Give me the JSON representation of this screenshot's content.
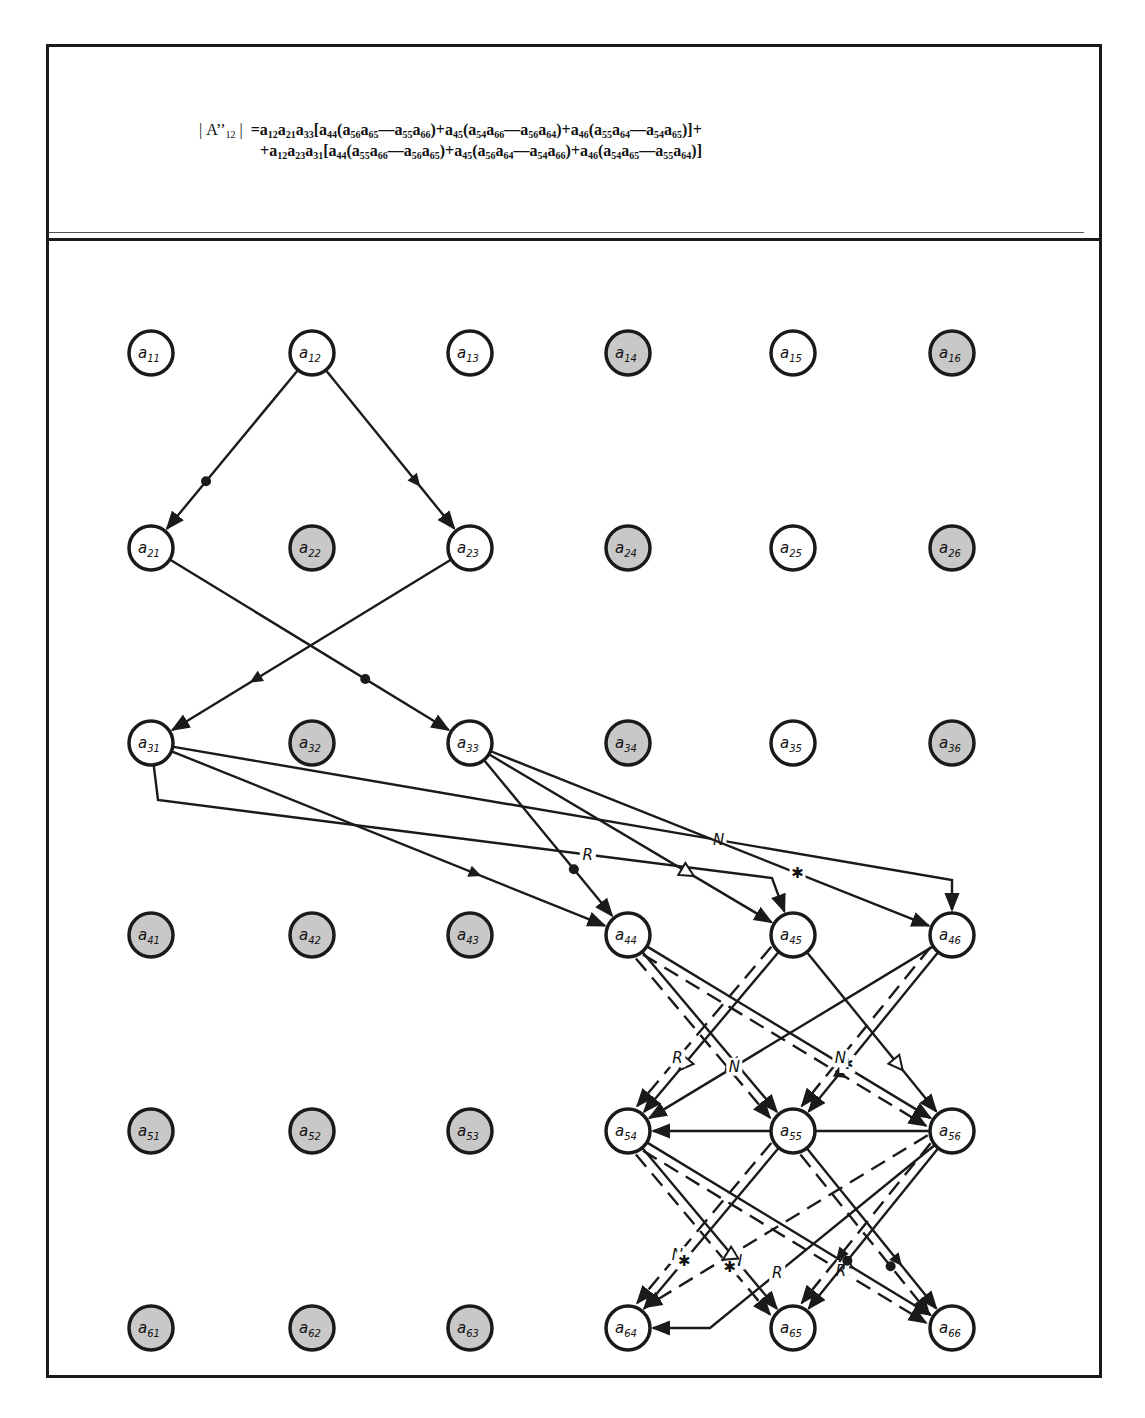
{
  "title_formula": {
    "lhs": "| A''12 |",
    "line1_tokens": [
      {
        "t": "a",
        "s": "12"
      },
      {
        "t": "a",
        "s": "21"
      },
      {
        "t": "a",
        "s": "33"
      },
      {
        "t": "["
      },
      {
        "t": "a",
        "s": "44"
      },
      {
        "t": "("
      },
      {
        "t": "a",
        "s": "56"
      },
      {
        "t": "a",
        "s": "65"
      },
      {
        "t": "—"
      },
      {
        "t": "a",
        "s": "55"
      },
      {
        "t": "a",
        "s": "66"
      },
      {
        "t": ")+"
      },
      {
        "t": "a",
        "s": "45"
      },
      {
        "t": "("
      },
      {
        "t": "a",
        "s": "54"
      },
      {
        "t": "a",
        "s": "66"
      },
      {
        "t": "—"
      },
      {
        "t": "a",
        "s": "56"
      },
      {
        "t": "a",
        "s": "64"
      },
      {
        "t": ")+"
      },
      {
        "t": "a",
        "s": "46"
      },
      {
        "t": "("
      },
      {
        "t": "a",
        "s": "55"
      },
      {
        "t": "a",
        "s": "64"
      },
      {
        "t": "—"
      },
      {
        "t": "a",
        "s": "54"
      },
      {
        "t": "a",
        "s": "65"
      },
      {
        "t": ")]+"
      }
    ],
    "line2_tokens": [
      {
        "t": "+"
      },
      {
        "t": "a",
        "s": "12"
      },
      {
        "t": "a",
        "s": "23"
      },
      {
        "t": "a",
        "s": "31"
      },
      {
        "t": "["
      },
      {
        "t": "a",
        "s": "44"
      },
      {
        "t": "("
      },
      {
        "t": "a",
        "s": "55"
      },
      {
        "t": "a",
        "s": "66"
      },
      {
        "t": "—"
      },
      {
        "t": "a",
        "s": "56"
      },
      {
        "t": "a",
        "s": "65"
      },
      {
        "t": ")+"
      },
      {
        "t": "a",
        "s": "45"
      },
      {
        "t": "("
      },
      {
        "t": "a",
        "s": "56"
      },
      {
        "t": "a",
        "s": "64"
      },
      {
        "t": "—"
      },
      {
        "t": "a",
        "s": "54"
      },
      {
        "t": "a",
        "s": "66"
      },
      {
        "t": ")+"
      },
      {
        "t": "a",
        "s": "46"
      },
      {
        "t": "("
      },
      {
        "t": "a",
        "s": "54"
      },
      {
        "t": "a",
        "s": "65"
      },
      {
        "t": "—"
      },
      {
        "t": "a",
        "s": "55"
      },
      {
        "t": "a",
        "s": "64"
      },
      {
        "t": ")]"
      }
    ],
    "text_line1": "|A''12| = a12a21a33[a44(a56a65—a55a66)+a45(a54a66—a56a64)+a46(a55a64—a54a65)]+",
    "text_line2": "+a12a23a31[a44(a55a66—a56a65)+a45(a56a64—a54a66)+a46(a54a65—a55a64)]"
  },
  "colors": {
    "ink": "#1a1a1a",
    "node_white": "#ffffff",
    "node_shaded": "#c8c8c8"
  },
  "grid": {
    "col_x": [
      151,
      312,
      470,
      628,
      793,
      952
    ],
    "row_y": [
      353,
      548,
      743,
      935,
      1131,
      1328
    ],
    "radius": 22
  },
  "nodes": [
    {
      "id": "a11",
      "label": "a",
      "sub": "11",
      "shaded": false
    },
    {
      "id": "a12",
      "label": "a",
      "sub": "12",
      "shaded": false
    },
    {
      "id": "a13",
      "label": "a",
      "sub": "13",
      "shaded": false
    },
    {
      "id": "a14",
      "label": "a",
      "sub": "14",
      "shaded": true
    },
    {
      "id": "a15",
      "label": "a",
      "sub": "15",
      "shaded": false
    },
    {
      "id": "a16",
      "label": "a",
      "sub": "16",
      "shaded": true
    },
    {
      "id": "a21",
      "label": "a",
      "sub": "21",
      "shaded": false
    },
    {
      "id": "a22",
      "label": "a",
      "sub": "22",
      "shaded": true
    },
    {
      "id": "a23",
      "label": "a",
      "sub": "23",
      "shaded": false
    },
    {
      "id": "a24",
      "label": "a",
      "sub": "24",
      "shaded": true
    },
    {
      "id": "a25",
      "label": "a",
      "sub": "25",
      "shaded": false
    },
    {
      "id": "a26",
      "label": "a",
      "sub": "26",
      "shaded": true
    },
    {
      "id": "a31",
      "label": "a",
      "sub": "31",
      "shaded": false
    },
    {
      "id": "a32",
      "label": "a",
      "sub": "32",
      "shaded": true
    },
    {
      "id": "a33",
      "label": "a",
      "sub": "33",
      "shaded": false
    },
    {
      "id": "a34",
      "label": "a",
      "sub": "34",
      "shaded": true
    },
    {
      "id": "a35",
      "label": "a",
      "sub": "35",
      "shaded": false
    },
    {
      "id": "a36",
      "label": "a",
      "sub": "36",
      "shaded": true
    },
    {
      "id": "a41",
      "label": "a",
      "sub": "41",
      "shaded": true
    },
    {
      "id": "a42",
      "label": "a",
      "sub": "42",
      "shaded": true
    },
    {
      "id": "a43",
      "label": "a",
      "sub": "43",
      "shaded": true
    },
    {
      "id": "a44",
      "label": "a",
      "sub": "44",
      "shaded": false
    },
    {
      "id": "a45",
      "label": "a",
      "sub": "45",
      "shaded": false
    },
    {
      "id": "a46",
      "label": "a",
      "sub": "46",
      "shaded": false
    },
    {
      "id": "a51",
      "label": "a",
      "sub": "51",
      "shaded": true
    },
    {
      "id": "a52",
      "label": "a",
      "sub": "52",
      "shaded": true
    },
    {
      "id": "a53",
      "label": "a",
      "sub": "53",
      "shaded": true
    },
    {
      "id": "a54",
      "label": "a",
      "sub": "54",
      "shaded": false
    },
    {
      "id": "a55",
      "label": "a",
      "sub": "55",
      "shaded": false
    },
    {
      "id": "a56",
      "label": "a",
      "sub": "56",
      "shaded": false
    },
    {
      "id": "a61",
      "label": "a",
      "sub": "61",
      "shaded": true
    },
    {
      "id": "a62",
      "label": "a",
      "sub": "62",
      "shaded": true
    },
    {
      "id": "a63",
      "label": "a",
      "sub": "63",
      "shaded": true
    },
    {
      "id": "a64",
      "label": "a",
      "sub": "64",
      "shaded": false
    },
    {
      "id": "a65",
      "label": "a",
      "sub": "65",
      "shaded": false
    },
    {
      "id": "a66",
      "label": "a",
      "sub": "66",
      "shaded": false
    }
  ],
  "edges": [
    {
      "from": "a12",
      "to": "a21",
      "style": "solid",
      "marker": "dot"
    },
    {
      "from": "a12",
      "to": "a23",
      "style": "solid",
      "marker": "triangle"
    },
    {
      "from": "a21",
      "to": "a33",
      "style": "solid",
      "marker": "dot"
    },
    {
      "from": "a23",
      "to": "a31",
      "style": "solid",
      "marker": "triangle"
    },
    {
      "from": "a31",
      "to": "a44",
      "style": "solid",
      "marker": "triangle"
    },
    {
      "from": "a31",
      "to": "a46",
      "style": "solid",
      "marker": "N",
      "route": "via",
      "via": [
        [
          952,
          880
        ]
      ]
    },
    {
      "from": "a31",
      "to": "a45",
      "style": "solid",
      "marker": "R",
      "route": "elbow",
      "via": [
        [
          158,
          800
        ],
        [
          772,
          878
        ]
      ]
    },
    {
      "from": "a33",
      "to": "a44",
      "style": "solid",
      "marker": "dot"
    },
    {
      "from": "a33",
      "to": "a45",
      "style": "solid",
      "marker": "open-triangle"
    },
    {
      "from": "a33",
      "to": "a46",
      "style": "solid",
      "marker": "star"
    },
    {
      "from": "a44",
      "to": "a55",
      "style": "solid",
      "marker": "triangle"
    },
    {
      "from": "a44",
      "to": "a56",
      "style": "solid",
      "marker": "R"
    },
    {
      "from": "a44",
      "to": "a55",
      "style": "dashed",
      "marker": "dot"
    },
    {
      "from": "a44",
      "to": "a56",
      "style": "dashed",
      "marker": "triangle"
    },
    {
      "from": "a45",
      "to": "a54",
      "style": "solid",
      "marker": "open-triangle"
    },
    {
      "from": "a45",
      "to": "a56",
      "style": "solid",
      "marker": "open-triangle"
    },
    {
      "from": "a45",
      "to": "a54",
      "style": "dashed",
      "marker": "R"
    },
    {
      "from": "a46",
      "to": "a54",
      "style": "solid",
      "marker": "N"
    },
    {
      "from": "a46",
      "to": "a55",
      "style": "solid",
      "marker": "star"
    },
    {
      "from": "a46",
      "to": "a55",
      "style": "dashed",
      "marker": "N"
    },
    {
      "from": "a54",
      "to": "a65",
      "style": "solid",
      "marker": "N"
    },
    {
      "from": "a54",
      "to": "a66",
      "style": "solid",
      "marker": "open-triangle"
    },
    {
      "from": "a54",
      "to": "a65",
      "style": "dashed",
      "marker": "star"
    },
    {
      "from": "a54",
      "to": "a66",
      "style": "dashed",
      "marker": "R"
    },
    {
      "from": "a55",
      "to": "a64",
      "style": "dashed",
      "marker": "N"
    },
    {
      "from": "a55",
      "to": "a66",
      "style": "solid",
      "marker": "triangle"
    },
    {
      "from": "a55",
      "to": "a64",
      "style": "solid",
      "marker": "star"
    },
    {
      "from": "a55",
      "to": "a66",
      "style": "dashed",
      "marker": "dot"
    },
    {
      "from": "a56",
      "to": "a64",
      "style": "dashed",
      "marker": "open-triangle"
    },
    {
      "from": "a56",
      "to": "a65",
      "style": "solid",
      "marker": "dot"
    },
    {
      "from": "a56",
      "to": "a64",
      "style": "solid",
      "marker": "R",
      "route": "elbow",
      "via": [
        [
          710,
          1328
        ]
      ]
    },
    {
      "from": "a56",
      "to": "a65",
      "style": "dashed",
      "marker": "triangle"
    },
    {
      "from": "a56",
      "to": "a54",
      "style": "solid",
      "marker": "star",
      "route": "elbow",
      "via": [
        [
          730,
          1131
        ]
      ]
    }
  ],
  "edge_labels_legend": {
    "dot": "●",
    "triangle": "▲",
    "open-triangle": "△",
    "star": "✱",
    "R": "R",
    "N": "N"
  }
}
